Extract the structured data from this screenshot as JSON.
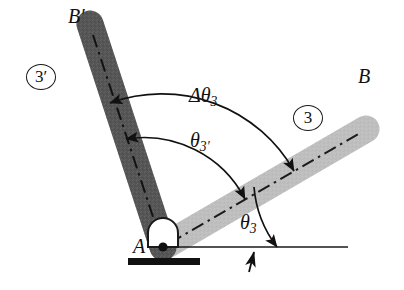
{
  "figure": {
    "background_color": "#ffffff",
    "width": 404,
    "height": 290
  },
  "labels": {
    "point_b": "B",
    "point_b_prime_base": "B",
    "point_b_prime_mark": "′",
    "pivot_a": "A",
    "delta_theta_base": "Δθ",
    "delta_theta_sub": "3",
    "theta_3_prime_base": "θ",
    "theta_3_prime_sub": "3′",
    "theta_3_base": "θ",
    "theta_3_sub": "3",
    "link_3": "3",
    "link_3_prime": "3′"
  },
  "links": {
    "current": {
      "name": "link-3",
      "label": "3",
      "end_label": "B",
      "color": "#c3c3c3",
      "edge_color": "#b0b0b0",
      "angle_deg": 30,
      "length": 235,
      "thickness": 26,
      "centerline_style": "dash-dot"
    },
    "displaced": {
      "name": "link-3-prime",
      "label": "3′",
      "end_label": "B′",
      "color": "#585858",
      "edge_color": "#4a4a4a",
      "angle_deg": 72,
      "length": 235,
      "thickness": 26,
      "centerline_style": "dash-dot"
    }
  },
  "pivot": {
    "name": "pivot-A",
    "label": "A",
    "center_x": 163,
    "center_y": 247,
    "housing_color": "#ffffff",
    "outline_color": "#1a1a1a",
    "pin_color": "#111111",
    "ground_base_color": "#111111"
  },
  "ground": {
    "datum_line_color": "#1a1a1a",
    "datum_line_from_x": 163,
    "datum_line_to_x": 348,
    "datum_line_y": 247,
    "base_from_x": 128,
    "base_to_x": 200,
    "base_y": 263
  },
  "angles": {
    "delta_theta_3": {
      "name": "delta-theta-3",
      "text": "Δθ₃",
      "from_link": "3",
      "to_link": "3′",
      "arc_radius": 152,
      "double_headed": true
    },
    "theta_3_prime": {
      "name": "theta-3-prime",
      "text": "θ₃′",
      "from_datum": true,
      "to_link": "3′",
      "arc_radius": 114,
      "double_headed": true
    },
    "theta_3": {
      "name": "theta-3",
      "text": "θ₃",
      "from_datum": true,
      "to_link": "3",
      "arc_radius": 114,
      "double_headed": false
    }
  },
  "markers": {
    "datum_tick": {
      "name": "datum-tick-arrow",
      "x": 252,
      "y": 247,
      "direction": "up"
    }
  }
}
